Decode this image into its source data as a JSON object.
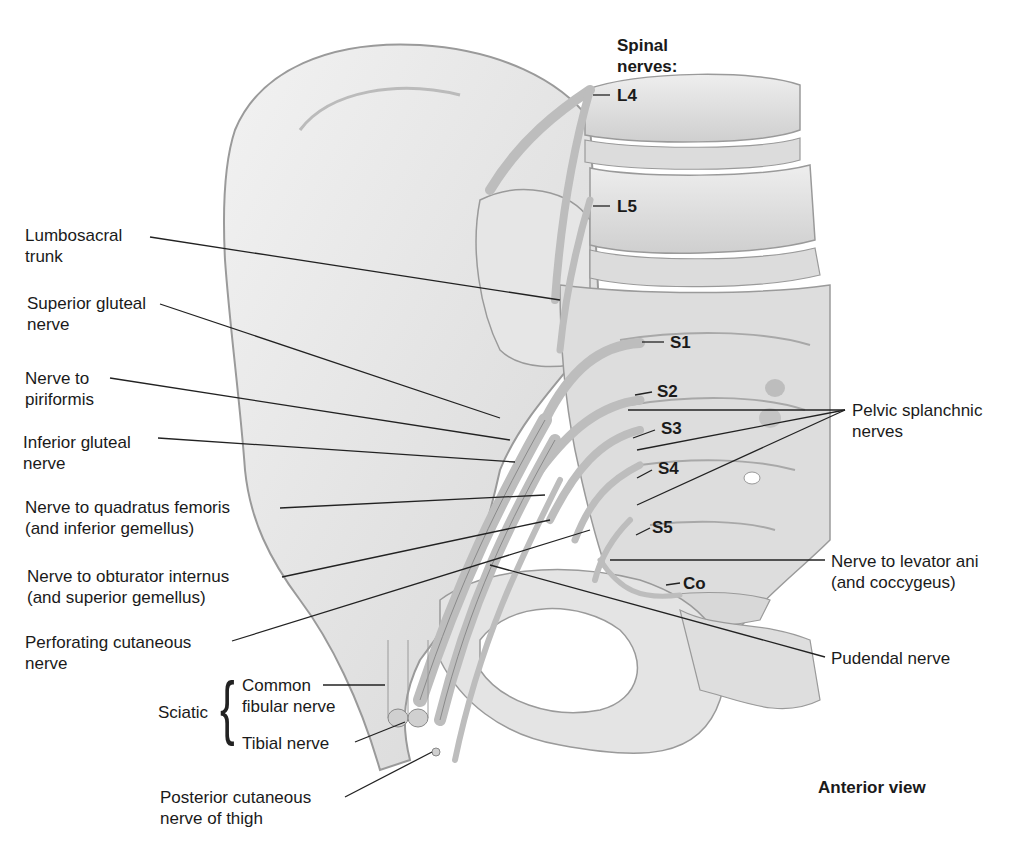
{
  "diagram": {
    "title": "Anterior view",
    "spinal_nerves_heading": [
      "Spinal",
      "nerves:"
    ],
    "spinal_levels": [
      "L4",
      "L5",
      "S1",
      "S2",
      "S3",
      "S4",
      "S5",
      "Co"
    ],
    "left_labels": [
      {
        "line1": "Lumbosacral",
        "line2": "trunk"
      },
      {
        "line1": "Superior gluteal",
        "line2": "nerve"
      },
      {
        "line1": "Nerve to",
        "line2": "piriformis"
      },
      {
        "line1": "Inferior gluteal",
        "line2": "nerve"
      },
      {
        "line1": "Nerve to quadratus femoris",
        "line2": "(and inferior gemellus)"
      },
      {
        "line1": "Nerve to obturator internus",
        "line2": "(and superior gemellus)"
      },
      {
        "line1": "Perforating cutaneous",
        "line2": "nerve"
      }
    ],
    "sciatic": {
      "label": "Sciatic",
      "branches": [
        {
          "line1": "Common",
          "line2": "fibular nerve"
        },
        {
          "line1": "Tibial nerve"
        }
      ]
    },
    "posterior_cutaneous": {
      "line1": "Posterior cutaneous",
      "line2": "nerve of thigh"
    },
    "right_labels": [
      {
        "line1": "Pelvic splanchnic",
        "line2": "nerves"
      },
      {
        "line1": "Nerve to levator ani",
        "line2": "(and coccygeus)"
      },
      {
        "line1": "Pudendal nerve"
      }
    ]
  }
}
